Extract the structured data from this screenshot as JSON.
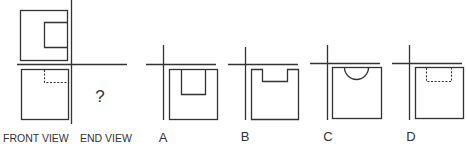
{
  "problem": {
    "type": "orthographic projection - select end view",
    "question_mark": "?",
    "labels": {
      "front_view": "FRONT VIEW",
      "end_view": "END VIEW"
    }
  },
  "options": [
    {
      "letter": "A",
      "description": "square with solid rectangular notch from top center"
    },
    {
      "letter": "B",
      "description": "square with wide shallow rectangular notch cut from top edge"
    },
    {
      "letter": "C",
      "description": "square with semicircular notch cut from top edge"
    },
    {
      "letter": "D",
      "description": "square with hidden (dashed) rectangle at top center"
    }
  ],
  "colors": {
    "line": "#333333",
    "background": "#ffffff"
  }
}
